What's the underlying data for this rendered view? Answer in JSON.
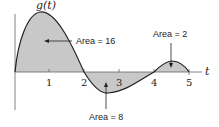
{
  "function_label": "g(t)",
  "axis_label": "t",
  "ticks": [
    "1",
    "2",
    "3",
    "4",
    "5"
  ],
  "annotations": {
    "area1": "Area = 16",
    "area2": "Area = 8",
    "area3": "Area = 2"
  },
  "colors": {
    "fill": "#c8c8c8",
    "curve": "#222222"
  }
}
